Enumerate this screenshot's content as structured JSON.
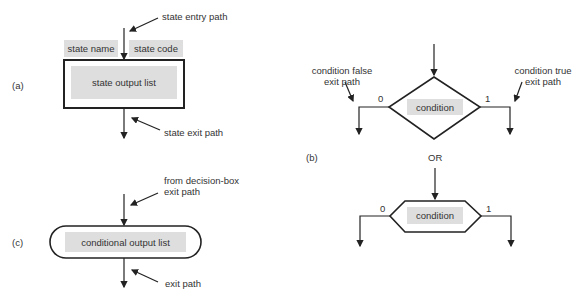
{
  "part_a": {
    "label": "(a)",
    "entry_annotation": "state entry path",
    "state_name": "state name",
    "state_code": "state code",
    "output_list": "state output list",
    "exit_annotation": "state exit path"
  },
  "part_b": {
    "label": "(b)",
    "false_annotation_line1": "condition false",
    "false_annotation_line2": "exit path",
    "true_annotation_line1": "condition true",
    "true_annotation_line2": "exit path",
    "diamond_condition": "condition",
    "false_value": "0",
    "true_value": "1",
    "or_label": "OR",
    "hexagon_condition": "condition",
    "hex_false_value": "0",
    "hex_true_value": "1"
  },
  "part_c": {
    "label": "(c)",
    "entry_annotation_line1": "from decision-box",
    "entry_annotation_line2": "exit path",
    "output_list": "conditional output list",
    "exit_annotation": "exit path"
  }
}
